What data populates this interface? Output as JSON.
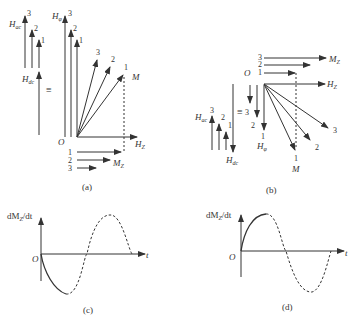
{
  "header_fragment": "",
  "panel_a": {
    "caption": "(a)",
    "h_ac_label": "H",
    "h_ac_sub": "ac",
    "h_dc_label": "H",
    "h_dc_sub": "dc",
    "h_phi_label": "H",
    "h_phi_sub": "φ",
    "equiv": "≡",
    "origin": "O",
    "hz_label": "H",
    "hz_sub": "Z",
    "m_label": "M",
    "mz_label": "M",
    "mz_sub": "Z",
    "nums": [
      "1",
      "2",
      "3"
    ]
  },
  "panel_b": {
    "caption": "(b)",
    "h_ac_label": "H",
    "h_ac_sub": "ac",
    "h_dc_label": "H",
    "h_dc_sub": "dc",
    "h_phi_label": "H",
    "h_phi_sub": "φ",
    "equiv": "≡",
    "origin": "O",
    "hz_label": "H",
    "hz_sub": "Z",
    "m_label": "M",
    "mz_label": "M",
    "mz_sub": "Z",
    "nums": [
      "1",
      "2",
      "3"
    ]
  },
  "panel_c": {
    "caption": "(c)",
    "ylabel": "dM",
    "ylabel_sub": "Z",
    "ylabel_tail": "/dt",
    "origin": "O",
    "xlabel": "t"
  },
  "panel_d": {
    "caption": "(d)",
    "ylabel": "dM",
    "ylabel_sub": "Z",
    "ylabel_tail": "/dt",
    "origin": "O",
    "xlabel": "t"
  }
}
